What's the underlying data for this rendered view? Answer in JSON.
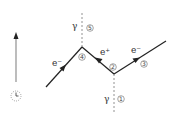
{
  "diagram": {
    "type": "feynman-diagram",
    "time_axis": {
      "icon": "clock-icon",
      "direction": "up",
      "color": "#999999"
    },
    "particles": [
      {
        "id": "photon-in",
        "label": "γ",
        "index": "1",
        "style": "dashed"
      },
      {
        "id": "positron",
        "label": "e⁺",
        "index": "2",
        "style": "solid-arrow"
      },
      {
        "id": "electron-out",
        "label": "e⁻",
        "index": "3",
        "style": "solid-arrow"
      },
      {
        "id": "electron-in",
        "label": "e⁻",
        "index": "4",
        "style": "solid-arrow"
      },
      {
        "id": "photon-out",
        "label": "γ",
        "index": "5",
        "style": "dashed"
      }
    ],
    "labels": {
      "gamma_top": "γ",
      "gamma_bottom": "γ",
      "e_left": "e⁻",
      "e_mid": "e⁺",
      "e_right": "e⁻",
      "n1": "1",
      "n2": "2",
      "n3": "3",
      "n4": "4",
      "n5": "5"
    }
  }
}
